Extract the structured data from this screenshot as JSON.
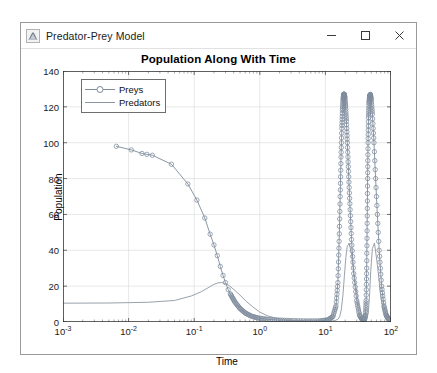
{
  "window": {
    "title": "Predator-Prey Model",
    "icon": "matlab-membrane-icon",
    "controls": {
      "minimize": "–",
      "maximize": "□",
      "close": "✕"
    }
  },
  "chart_data": {
    "type": "line",
    "title": "Population Along With Time",
    "xlabel": "Time",
    "ylabel": "Population",
    "xscale": "log",
    "yscale": "linear",
    "xlim": [
      0.001,
      100
    ],
    "ylim": [
      0,
      140
    ],
    "grid": true,
    "legend_position": "upper left",
    "yticks": [
      0,
      20,
      40,
      60,
      80,
      100,
      120,
      140
    ],
    "ytick_labels": [
      "0",
      "20",
      "40",
      "60",
      "80",
      "100",
      "120",
      "140"
    ],
    "xticks": [
      0.001,
      0.01,
      0.1,
      1,
      10,
      100
    ],
    "xtick_labels": [
      "10-3",
      "10-2",
      "10-1",
      "100",
      "101",
      "102"
    ],
    "xtick_mantissa": "10",
    "xtick_exponents": [
      "-3",
      "-2",
      "-1",
      "0",
      "1",
      "2"
    ],
    "series": [
      {
        "name": "Preys",
        "marker": "circle",
        "color": "#7d8b9c",
        "x": [
          0.0065,
          0.011,
          0.016,
          0.019,
          0.023,
          0.045,
          0.08,
          0.11,
          0.145,
          0.175,
          0.2,
          0.225,
          0.25,
          0.275,
          0.3,
          0.33,
          0.37,
          0.42,
          0.5,
          0.6,
          0.75,
          0.95,
          1.3,
          1.9,
          3.0,
          5.0,
          8.0,
          11.0,
          13.0,
          14.5,
          15.5,
          16.2,
          16.8,
          17.3,
          17.8,
          18.2,
          18.6,
          19.0,
          19.4,
          19.8,
          20.3,
          20.9,
          21.6,
          22.5,
          23.6,
          25.0,
          27.0,
          30.0,
          33.0,
          36.0,
          38.0,
          39.5,
          40.8,
          41.8,
          42.6,
          43.3,
          44.0,
          44.7,
          45.4,
          46.2,
          47.2,
          48.5,
          50.0,
          52.0,
          55.0,
          60.0,
          66.0,
          72.0,
          78.0,
          84.0,
          90.0,
          96.0
        ],
        "y": [
          98,
          96,
          94,
          93.5,
          93,
          88,
          77,
          68,
          58,
          49,
          43,
          37,
          31,
          26,
          22,
          18,
          14.5,
          11,
          7.5,
          5.0,
          3.2,
          2.2,
          1.5,
          1.1,
          0.8,
          0.6,
          0.6,
          1.2,
          3.0,
          9.0,
          22.0,
          45.0,
          70.0,
          92.0,
          108.0,
          118.0,
          124.0,
          127.0,
          127.0,
          125.0,
          120.0,
          112.0,
          100.0,
          84.0,
          66.0,
          46.0,
          27.0,
          12.0,
          4.0,
          1.6,
          1.0,
          1.4,
          4.0,
          12.0,
          30.0,
          55.0,
          80.0,
          100.0,
          114.0,
          122.0,
          126.0,
          127.0,
          124.0,
          116.0,
          100.0,
          70.0,
          40.0,
          20.0,
          9.0,
          4.0,
          2.0,
          1.2
        ]
      },
      {
        "name": "Predators",
        "marker": "none",
        "color": "#8c96a3",
        "x": [
          0.001,
          0.005,
          0.02,
          0.05,
          0.09,
          0.13,
          0.17,
          0.2,
          0.23,
          0.26,
          0.3,
          0.35,
          0.42,
          0.5,
          0.62,
          0.78,
          1.0,
          1.3,
          1.8,
          2.5,
          3.5,
          5.0,
          7.0,
          9.5,
          12.0,
          14.0,
          15.5,
          16.5,
          17.5,
          18.5,
          19.5,
          20.5,
          21.5,
          23.0,
          25.0,
          28.0,
          32.0,
          36.0,
          40.0,
          43.0,
          45.0,
          47.0,
          49.0,
          52.0,
          56.0,
          62.0,
          70.0,
          80.0,
          90.0,
          100.0
        ],
        "y": [
          10.5,
          10.6,
          11.0,
          12.0,
          14.5,
          17.0,
          19.5,
          21.0,
          21.8,
          22.0,
          21.5,
          20.0,
          17.5,
          15.0,
          11.5,
          8.5,
          5.5,
          3.5,
          2.0,
          1.2,
          0.8,
          0.5,
          0.4,
          0.4,
          0.5,
          0.8,
          1.5,
          3.0,
          7.0,
          15.0,
          26.0,
          36.0,
          42.0,
          44.0,
          38.0,
          24.0,
          10.0,
          3.5,
          1.5,
          2.0,
          5.0,
          14.0,
          28.0,
          41.0,
          44.0,
          32.0,
          14.0,
          4.0,
          1.5,
          0.8
        ]
      }
    ]
  }
}
